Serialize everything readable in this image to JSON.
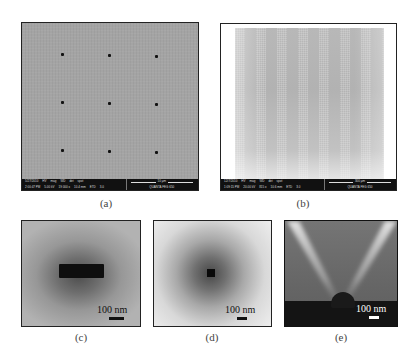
{
  "figure": {
    "panels": [
      {
        "id": "a",
        "caption": "(a)",
        "description": "SEM image: 3x3 array of nanoholes on gray substrate",
        "info_bar": {
          "row1": [
            "5/27/2010",
            "HV",
            "mag",
            "WD",
            "det",
            "spot"
          ],
          "row2": [
            "2:00:47 PM",
            "5.00 kV",
            "19 000 x",
            "10.4 mm",
            "ETD",
            "3.0"
          ],
          "scale_label": "10 µm",
          "instrument": "QUANTA FEG 650"
        }
      },
      {
        "id": "b",
        "caption": "(b)",
        "description": "SEM image: large-area array of nanohole patterns",
        "info_bar": {
          "row1": [
            "12/7/2010",
            "HV",
            "mag",
            "WD",
            "det",
            "spot"
          ],
          "row2": [
            "1:09:15 PM",
            "20.00 kV",
            "815 x",
            "10.6 mm",
            "ETD",
            "3.0"
          ],
          "scale_label": "300 µm",
          "instrument": "QUANTA FEG 650"
        }
      },
      {
        "id": "c",
        "caption": "(c)",
        "description": "Close-up: rectangular slot nanohole",
        "scale_label": "100 nm"
      },
      {
        "id": "d",
        "caption": "(d)",
        "description": "Close-up: square nanohole",
        "scale_label": "100 nm"
      },
      {
        "id": "e",
        "caption": "(e)",
        "description": "Cross-section: nanotip with emission cone",
        "scale_label": "100 nm"
      }
    ]
  }
}
